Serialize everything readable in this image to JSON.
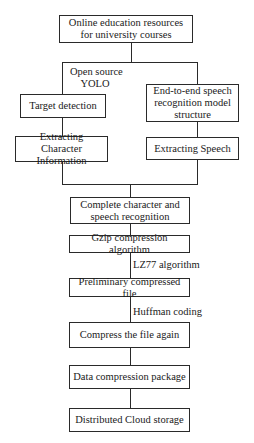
{
  "diagram": {
    "type": "flowchart",
    "nodes": {
      "source": "Online education resources for university courses",
      "target_detection": "Target detection",
      "speech_model": "End-to-end speech recognition model structure",
      "extract_char": "Extracting Character Information",
      "extract_speech": "Extracting Speech",
      "complete": "Complete character and speech recognition",
      "gzip": "Gzip compression algorithm",
      "preliminary": "Preliminary compressed file",
      "compress_again": "Compress the file again",
      "package": "Data compression package",
      "storage": "Distributed Cloud storage"
    },
    "edge_labels": {
      "yolo_line1": "Open source",
      "yolo_line2": "YOLO",
      "lz77": "LZ77 algorithm",
      "huffman": "Huffman coding"
    },
    "colors": {
      "line": "#2a2a2a",
      "text": "#1a1a1a",
      "background": "#ffffff"
    }
  }
}
